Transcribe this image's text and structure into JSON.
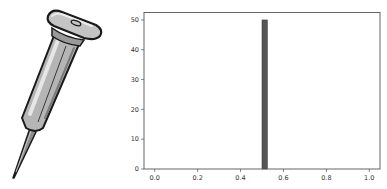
{
  "illustration": {
    "subject": "push-pin",
    "description": "Cartoon gray push pin / thumbtack with flat oval head and sharp needle pointing down-left",
    "colors": {
      "outline": "#1a1a1a",
      "body": "#b5b5b5",
      "highlight": "#e6e6e6",
      "shadow": "#7a7a7a",
      "needle": "#8c8c8c"
    }
  },
  "chart_data": {
    "type": "bar",
    "subtype": "histogram",
    "title": "",
    "xlabel": "",
    "ylabel": "",
    "xlim": [
      -0.05,
      1.05
    ],
    "ylim": [
      0,
      52.5
    ],
    "grid": false,
    "legend": null,
    "x_ticks": [
      0.0,
      0.2,
      0.4,
      0.6,
      0.8,
      1.0
    ],
    "x_tick_labels": [
      "0.0",
      "0.2",
      "0.4",
      "0.6",
      "0.8",
      "1.0"
    ],
    "y_ticks": [
      0,
      10,
      20,
      30,
      40,
      50
    ],
    "y_tick_labels": [
      "0",
      "10",
      "20",
      "30",
      "40",
      "50"
    ],
    "bins": [
      {
        "x_start": 0.5,
        "x_end": 0.525,
        "count": 50
      }
    ],
    "categories": [
      "0.5-0.525"
    ],
    "values": [
      50
    ],
    "bar_color": "#555555",
    "bar_edge_color": "#333333"
  }
}
